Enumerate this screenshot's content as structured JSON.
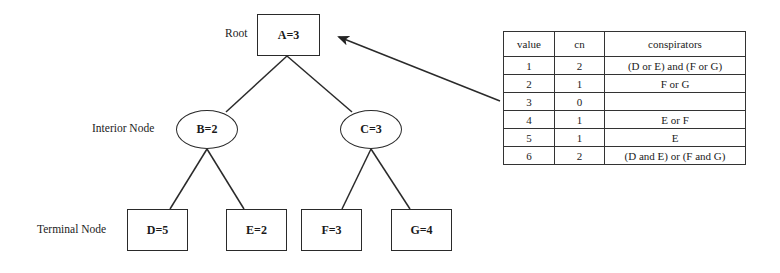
{
  "diagram": {
    "labels": {
      "root": "Root",
      "interior": "Interior Node",
      "terminal": "Terminal Node"
    },
    "nodes": {
      "A": "A=3",
      "B": "B=2",
      "C": "C=3",
      "D": "D=5",
      "E": "E=2",
      "F": "F=3",
      "G": "G=4"
    },
    "edges": [
      [
        "A",
        "B"
      ],
      [
        "A",
        "C"
      ],
      [
        "B",
        "D"
      ],
      [
        "B",
        "E"
      ],
      [
        "C",
        "F"
      ],
      [
        "C",
        "G"
      ]
    ],
    "arrow": {
      "from": "table",
      "to": "A"
    }
  },
  "table": {
    "headers": [
      "value",
      "cn",
      "conspirators"
    ],
    "rows": [
      [
        "1",
        "2",
        "(D or E) and (F or G)"
      ],
      [
        "2",
        "1",
        "F or G"
      ],
      [
        "3",
        "0",
        ""
      ],
      [
        "4",
        "1",
        "E or F"
      ],
      [
        "5",
        "1",
        "E"
      ],
      [
        "6",
        "2",
        "(D and E) or (F and G)"
      ]
    ]
  }
}
